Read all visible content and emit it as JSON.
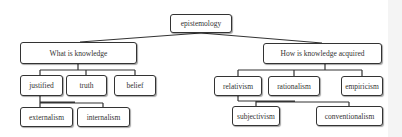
{
  "diagram": {
    "type": "concept-tree",
    "root": {
      "id": "epistemology",
      "label": "epistemology"
    },
    "nodes": {
      "epistemology": {
        "label": "epistemology",
        "x": 170,
        "y": 14,
        "w": 62,
        "h": 19
      },
      "what": {
        "label": "What is knowledge",
        "x": 20,
        "y": 42,
        "w": 117,
        "h": 22
      },
      "how": {
        "label": "How is knowledge acquired",
        "x": 263,
        "y": 43,
        "w": 119,
        "h": 21
      },
      "justified": {
        "label": "justified",
        "x": 20,
        "y": 75,
        "w": 43,
        "h": 21
      },
      "truth": {
        "label": "truth",
        "x": 66,
        "y": 75,
        "w": 41,
        "h": 21
      },
      "belief": {
        "label": "belief",
        "x": 114,
        "y": 75,
        "w": 42,
        "h": 21
      },
      "externalism": {
        "label": "externalism",
        "x": 20,
        "y": 107,
        "w": 53,
        "h": 20
      },
      "internalism": {
        "label": "internalism",
        "x": 77,
        "y": 107,
        "w": 53,
        "h": 20
      },
      "relativism": {
        "label": "relativism",
        "x": 214,
        "y": 76,
        "w": 48,
        "h": 20
      },
      "rationalism": {
        "label": "rationalism",
        "x": 268,
        "y": 76,
        "w": 52,
        "h": 20
      },
      "empiricism": {
        "label": "empiricism",
        "x": 341,
        "y": 76,
        "w": 42,
        "h": 20
      },
      "subjectivism": {
        "label": "subjectivism",
        "x": 232,
        "y": 106,
        "w": 48,
        "h": 20
      },
      "conventionalism": {
        "label": "conventionalism",
        "x": 316,
        "y": 106,
        "w": 67,
        "h": 20
      }
    },
    "edges": [
      [
        "epistemology",
        "what"
      ],
      [
        "epistemology",
        "how"
      ],
      [
        "what",
        "justified"
      ],
      [
        "what",
        "truth"
      ],
      [
        "what",
        "belief"
      ],
      [
        "justified",
        "externalism"
      ],
      [
        "justified",
        "internalism"
      ],
      [
        "how",
        "relativism"
      ],
      [
        "how",
        "rationalism"
      ],
      [
        "how",
        "empiricism"
      ],
      [
        "relativism",
        "subjectivism"
      ],
      [
        "relativism",
        "conventionalism"
      ]
    ],
    "colors": {
      "border": "#333333",
      "line": "#333333",
      "background": "#ffffff",
      "text": "#333333"
    }
  }
}
